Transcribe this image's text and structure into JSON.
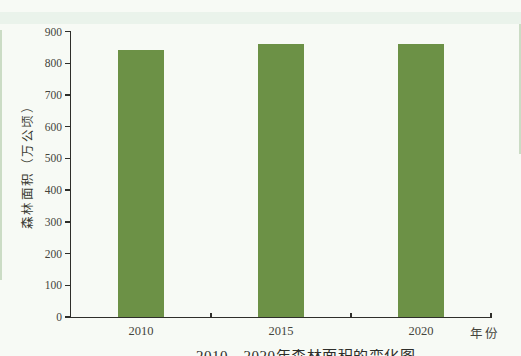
{
  "labels": {
    "y_axis_title": "森林面积（万公顷）",
    "x_axis_unit": "年份",
    "caption_clipped": "2010—2020年森林面积的变化图"
  },
  "chart_data": {
    "type": "bar",
    "title": "",
    "categories": [
      "2010",
      "2015",
      "2020"
    ],
    "values": [
      843,
      860,
      860
    ],
    "xlabel": "年份",
    "ylabel": "森林面积（万公顷）",
    "ylim": [
      0,
      900
    ],
    "yticks": [
      0,
      100,
      200,
      300,
      400,
      500,
      600,
      700,
      800,
      900
    ],
    "grid": false,
    "legend": "none",
    "bar_color": "#6c9146",
    "axis_color": "#2e2e2a",
    "background_color": "#f7faf5"
  }
}
